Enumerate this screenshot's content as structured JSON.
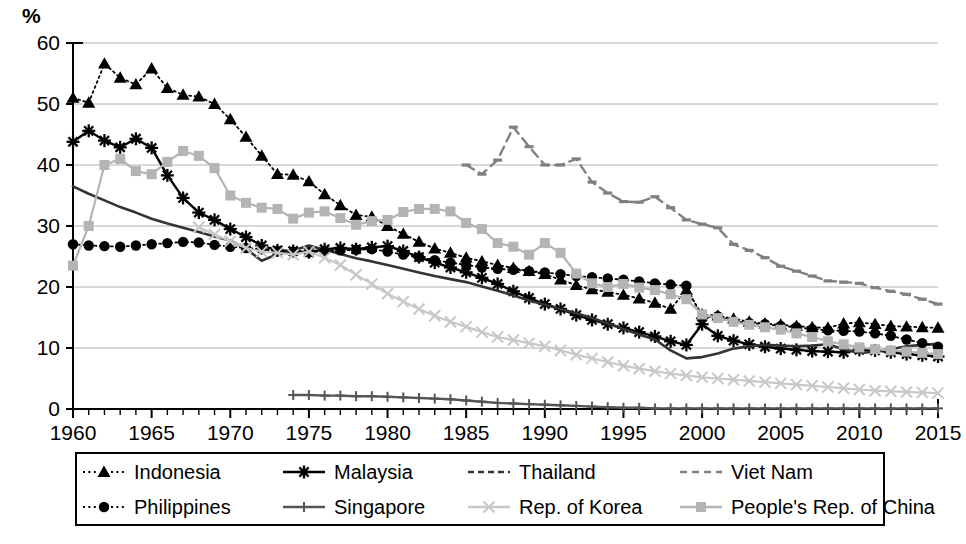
{
  "axis": {
    "unit_label": "%",
    "y_ticks": [
      "0",
      "10",
      "20",
      "30",
      "40",
      "50",
      "60"
    ],
    "x_ticks": [
      "1960",
      "1965",
      "1970",
      "1975",
      "1980",
      "1985",
      "1990",
      "1995",
      "2000",
      "2005",
      "2010",
      "2015"
    ]
  },
  "legend": {
    "items": [
      {
        "label": "Indonesia",
        "swatch": "dotted-line-triangle-marker",
        "color": "#000000"
      },
      {
        "label": "Malaysia",
        "swatch": "solid-line-star-marker",
        "color": "#000000"
      },
      {
        "label": "Thailand",
        "swatch": "dashed-dark-line",
        "color": "#333333"
      },
      {
        "label": "Viet Nam",
        "swatch": "long-dashed-gray-line",
        "color": "#808080"
      },
      {
        "label": "Philippines",
        "swatch": "dotted-line-circle-marker",
        "color": "#000000"
      },
      {
        "label": "Singapore",
        "swatch": "solid-line-plus-marker",
        "color": "#555555"
      },
      {
        "label": "Rep. of Korea",
        "swatch": "light-line-x-marker",
        "color": "#c8c8c8"
      },
      {
        "label": "People's Rep. of China",
        "swatch": "light-line-square-marker",
        "color": "#b4b4b4"
      }
    ]
  },
  "chart_data": {
    "type": "line",
    "title": "",
    "subtitle": "",
    "xlabel": "",
    "ylabel": "%",
    "xlim": [
      1960,
      2015
    ],
    "ylim": [
      0,
      60
    ],
    "ytick_step": 10,
    "grid": "horizontal",
    "legend_position": "bottom",
    "x": [
      1960,
      1961,
      1962,
      1963,
      1964,
      1965,
      1966,
      1967,
      1968,
      1969,
      1970,
      1971,
      1972,
      1973,
      1974,
      1975,
      1976,
      1977,
      1978,
      1979,
      1980,
      1981,
      1982,
      1983,
      1984,
      1985,
      1986,
      1987,
      1988,
      1989,
      1990,
      1991,
      1992,
      1993,
      1994,
      1995,
      1996,
      1997,
      1998,
      1999,
      2000,
      2001,
      2002,
      2003,
      2004,
      2005,
      2006,
      2007,
      2008,
      2009,
      2010,
      2011,
      2012,
      2013,
      2014,
      2015
    ],
    "series": [
      {
        "name": "Indonesia",
        "marker": "triangle",
        "line": "dotted",
        "color": "#000000",
        "values": [
          51.0,
          50.2,
          56.6,
          54.3,
          53.2,
          55.8,
          52.6,
          51.5,
          51.2,
          50.0,
          47.5,
          44.6,
          41.5,
          38.5,
          38.4,
          37.3,
          35.2,
          33.4,
          31.8,
          31.5,
          30.0,
          28.7,
          27.4,
          26.3,
          25.6,
          24.8,
          24.2,
          23.6,
          23.1,
          22.6,
          22.1,
          21.2,
          20.3,
          19.6,
          19.2,
          18.7,
          18.1,
          17.4,
          16.4,
          19.5,
          15.5,
          15.3,
          14.8,
          14.3,
          14.0,
          13.8,
          13.6,
          13.4,
          13.3,
          14.0,
          14.2,
          13.9,
          13.6,
          13.5,
          13.4,
          13.3
        ]
      },
      {
        "name": "Malaysia",
        "marker": "star",
        "line": "solid",
        "color": "#000000",
        "values": [
          43.8,
          45.6,
          44.0,
          42.9,
          44.3,
          42.8,
          38.3,
          34.6,
          32.2,
          31.0,
          29.5,
          28.2,
          26.8,
          26.0,
          25.9,
          25.7,
          26.2,
          26.4,
          26.2,
          26.5,
          26.7,
          25.9,
          24.9,
          24.0,
          23.2,
          22.4,
          21.5,
          20.5,
          19.3,
          18.2,
          17.2,
          16.4,
          15.4,
          14.6,
          13.9,
          13.3,
          12.6,
          11.9,
          11.1,
          10.5,
          13.9,
          12.0,
          11.2,
          10.6,
          10.2,
          9.9,
          9.7,
          9.5,
          9.4,
          9.3,
          9.7,
          9.6,
          9.3,
          9.0,
          8.8,
          8.6
        ]
      },
      {
        "name": "Thailand",
        "marker": "none",
        "line": "dashed-dark",
        "color": "#333333",
        "values": [
          36.5,
          35.3,
          34.2,
          33.1,
          32.2,
          31.2,
          30.4,
          29.7,
          29.0,
          28.3,
          27.6,
          26.3,
          24.3,
          25.4,
          26.0,
          26.8,
          26.1,
          25.4,
          24.7,
          24.2,
          23.6,
          23.0,
          22.4,
          21.8,
          21.3,
          20.8,
          20.1,
          19.4,
          18.6,
          17.8,
          17.1,
          16.4,
          15.7,
          14.9,
          14.0,
          13.1,
          12.2,
          11.4,
          9.6,
          8.3,
          8.5,
          9.1,
          9.9,
          10.3,
          10.5,
          10.4,
          10.3,
          10.4,
          10.6,
          9.8,
          9.2,
          9.4,
          9.8,
          10.3,
          10.5,
          10.7
        ]
      },
      {
        "name": "Viet Nam",
        "marker": "dash",
        "line": "long-dashed",
        "color": "#808080",
        "values": [
          null,
          null,
          null,
          null,
          null,
          null,
          null,
          null,
          null,
          null,
          null,
          null,
          null,
          null,
          null,
          null,
          null,
          null,
          null,
          null,
          null,
          null,
          null,
          null,
          null,
          40.0,
          38.5,
          40.8,
          46.2,
          43.0,
          40.0,
          40.0,
          41.0,
          37.2,
          35.4,
          34.0,
          33.9,
          34.8,
          33.0,
          31.0,
          30.3,
          29.7,
          27.0,
          26.0,
          24.8,
          23.4,
          22.6,
          21.8,
          21.0,
          20.8,
          20.6,
          19.9,
          19.3,
          18.8,
          18.0,
          17.2
        ]
      },
      {
        "name": "Philippines",
        "marker": "circle",
        "line": "dotted",
        "color": "#000000",
        "values": [
          27.0,
          26.8,
          26.7,
          26.6,
          26.8,
          27.0,
          27.2,
          27.4,
          27.3,
          26.9,
          26.6,
          26.4,
          26.2,
          25.9,
          25.8,
          25.7,
          25.9,
          26.0,
          26.1,
          26.2,
          25.8,
          25.3,
          24.9,
          24.4,
          24.0,
          23.6,
          23.2,
          23.0,
          22.8,
          22.6,
          22.4,
          22.1,
          21.8,
          21.6,
          21.4,
          21.2,
          20.9,
          20.6,
          20.4,
          20.2,
          15.0,
          15.2,
          14.4,
          14.1,
          13.9,
          13.6,
          13.4,
          13.1,
          12.9,
          12.8,
          12.7,
          12.4,
          12.0,
          11.4,
          10.8,
          10.2
        ]
      },
      {
        "name": "Singapore",
        "marker": "plus",
        "line": "solid",
        "color": "#555555",
        "values": [
          null,
          null,
          null,
          null,
          null,
          null,
          null,
          null,
          null,
          null,
          null,
          null,
          null,
          null,
          2.3,
          2.3,
          2.2,
          2.2,
          2.1,
          2.1,
          2.0,
          1.9,
          1.8,
          1.7,
          1.6,
          1.4,
          1.2,
          1.0,
          0.9,
          0.8,
          0.7,
          0.6,
          0.5,
          0.4,
          0.3,
          0.2,
          0.2,
          0.1,
          0.1,
          0.1,
          0.1,
          0.1,
          0.1,
          0.1,
          0.1,
          0.1,
          0.1,
          0.1,
          0.1,
          0.1,
          0.1,
          0.1,
          0.1,
          0.1,
          0.1,
          0.1
        ]
      },
      {
        "name": "Rep. of Korea",
        "marker": "x",
        "line": "solid-light",
        "color": "#c8c8c8",
        "values": [
          null,
          null,
          null,
          null,
          null,
          null,
          null,
          null,
          29.8,
          28.6,
          27.5,
          26.4,
          25.8,
          25.6,
          25.3,
          25.8,
          24.8,
          23.6,
          22.0,
          20.5,
          18.9,
          17.6,
          16.4,
          15.3,
          14.3,
          13.5,
          12.6,
          11.8,
          11.3,
          10.8,
          10.3,
          9.6,
          8.9,
          8.3,
          7.7,
          7.1,
          6.6,
          6.2,
          5.8,
          5.5,
          5.2,
          5.0,
          4.8,
          4.6,
          4.4,
          4.2,
          4.0,
          3.8,
          3.6,
          3.4,
          3.2,
          3.0,
          2.9,
          2.8,
          2.7,
          2.6
        ]
      },
      {
        "name": "People's Rep. of China",
        "marker": "square",
        "line": "solid-light",
        "color": "#b4b4b4",
        "values": [
          23.5,
          30.0,
          40.0,
          41.0,
          39.0,
          38.5,
          40.5,
          42.3,
          41.5,
          39.5,
          35.0,
          33.8,
          33.0,
          32.8,
          31.2,
          32.2,
          32.4,
          31.3,
          30.2,
          30.8,
          31.0,
          32.3,
          32.8,
          32.8,
          32.4,
          30.5,
          29.5,
          27.2,
          26.6,
          25.3,
          27.2,
          25.6,
          22.2,
          20.6,
          20.0,
          20.5,
          19.9,
          19.5,
          18.8,
          18.0,
          15.5,
          14.9,
          14.3,
          13.8,
          13.4,
          13.0,
          12.4,
          11.8,
          11.1,
          10.6,
          10.1,
          9.8,
          9.6,
          9.4,
          9.2,
          9.0
        ]
      }
    ]
  }
}
